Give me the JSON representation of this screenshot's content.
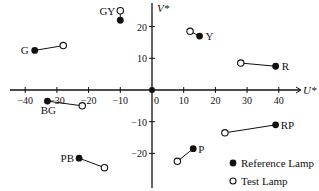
{
  "chart_data": {
    "type": "scatter",
    "title": "",
    "xlabel": "U*",
    "ylabel": "V*",
    "xlim": [
      -45,
      45
    ],
    "ylim": [
      -28,
      28
    ],
    "x_ticks": [
      -40,
      -30,
      -20,
      -10,
      0,
      10,
      20,
      30,
      40
    ],
    "y_ticks": [
      -20,
      -10,
      10,
      20
    ],
    "grid": false,
    "legend_position": "lower right",
    "legend": [
      {
        "label": "Reference Lamp",
        "marker": "filled-circle"
      },
      {
        "label": "Test Lamp",
        "marker": "open-circle"
      }
    ],
    "series": [
      {
        "name": "Reference Lamp",
        "marker": "filled-circle",
        "points": [
          {
            "label": "GY",
            "u": -10,
            "v": 22
          },
          {
            "label": "G",
            "u": -37,
            "v": 12.5
          },
          {
            "label": "Y",
            "u": 15,
            "v": 17
          },
          {
            "label": "R",
            "u": 39,
            "v": 7.5
          },
          {
            "label": "BG",
            "u": -33,
            "v": -3.5
          },
          {
            "label": "PB",
            "u": -23,
            "v": -21.5
          },
          {
            "label": "RP",
            "u": 39,
            "v": -11
          },
          {
            "label": "P",
            "u": 13,
            "v": -18.5
          }
        ]
      },
      {
        "name": "Test Lamp",
        "marker": "open-circle",
        "points": [
          {
            "label": "GY",
            "u": -10,
            "v": 25
          },
          {
            "label": "G",
            "u": -28,
            "v": 14
          },
          {
            "label": "Y",
            "u": 12,
            "v": 18.5
          },
          {
            "label": "R",
            "u": 28,
            "v": 8.5
          },
          {
            "label": "BG",
            "u": -22,
            "v": -5
          },
          {
            "label": "PB",
            "u": -15,
            "v": -24.5
          },
          {
            "label": "RP",
            "u": 23,
            "v": -13.5
          },
          {
            "label": "P",
            "u": 8,
            "v": -22.5
          }
        ]
      }
    ],
    "origin_marker": {
      "u": 0,
      "v": 0,
      "marker": "filled-circle"
    },
    "point_labels": [
      {
        "text": "GY",
        "anchor": "left-of-test"
      },
      {
        "text": "G",
        "anchor": "left-of-ref"
      },
      {
        "text": "Y",
        "anchor": "right-of-ref"
      },
      {
        "text": "R",
        "anchor": "right-of-ref"
      },
      {
        "text": "BG",
        "anchor": "below-ref"
      },
      {
        "text": "PB",
        "anchor": "left-of-ref"
      },
      {
        "text": "RP",
        "anchor": "right-of-ref"
      },
      {
        "text": "P",
        "anchor": "right-of-ref"
      }
    ]
  }
}
